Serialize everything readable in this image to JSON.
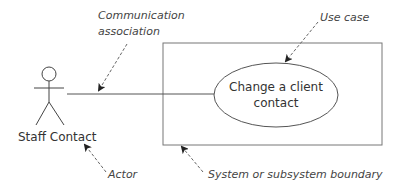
{
  "diagram": {
    "type": "UML use case diagram",
    "actor": {
      "name": "Staff Contact"
    },
    "use_case": {
      "line1": "Change a client",
      "line2": "contact"
    },
    "annotations": {
      "communication_line1": "Communication",
      "communication_line2": "association",
      "use_case": "Use case",
      "actor": "Actor",
      "boundary": "System or subsystem boundary"
    },
    "colors": {
      "line": "#555555",
      "text": "#333333",
      "background": "#ffffff"
    }
  }
}
